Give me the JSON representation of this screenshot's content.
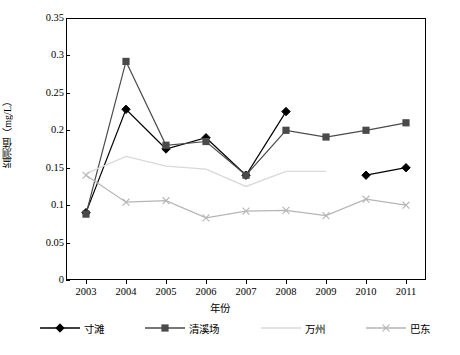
{
  "chart_data": {
    "type": "line",
    "title": "",
    "xlabel": "年份",
    "ylabel": "监测值（mg/L）",
    "categories": [
      "2003",
      "2004",
      "2005",
      "2006",
      "2007",
      "2008",
      "2009",
      "2010",
      "2011"
    ],
    "ylim": [
      0,
      0.35
    ],
    "yticks": [
      "0",
      "0.05",
      "0.1",
      "0.15",
      "0.2",
      "0.25",
      "0.3",
      "0.35"
    ],
    "ytick_values": [
      0,
      0.05,
      0.1,
      0.15,
      0.2,
      0.25,
      0.3,
      0.35
    ],
    "grid": false,
    "legend_position": "bottom",
    "series": [
      {
        "name": "寸滩",
        "color": "#000000",
        "marker": "diamond",
        "values": [
          0.09,
          0.228,
          0.175,
          0.19,
          0.14,
          0.225,
          null,
          0.14,
          0.15
        ]
      },
      {
        "name": "清溪场",
        "color": "#4a4a4a",
        "marker": "square",
        "values": [
          0.088,
          0.292,
          0.18,
          0.185,
          0.14,
          0.2,
          0.191,
          0.2,
          0.21
        ]
      },
      {
        "name": "万州",
        "color": "#d9d9d9",
        "marker": "none",
        "values": [
          0.142,
          0.165,
          0.152,
          0.148,
          0.125,
          0.145,
          0.145,
          null,
          null
        ]
      },
      {
        "name": "巴东",
        "color": "#b5b5b5",
        "marker": "cross",
        "values": [
          0.14,
          0.104,
          0.106,
          0.083,
          0.092,
          0.093,
          0.086,
          0.108,
          0.1
        ]
      }
    ]
  },
  "axis": {
    "x_label": "年份",
    "y_label": "监测值（mg/L）"
  },
  "legend": {
    "items": [
      {
        "label": "寸滩"
      },
      {
        "label": "清溪场"
      },
      {
        "label": "万州"
      },
      {
        "label": "巴东"
      }
    ]
  }
}
